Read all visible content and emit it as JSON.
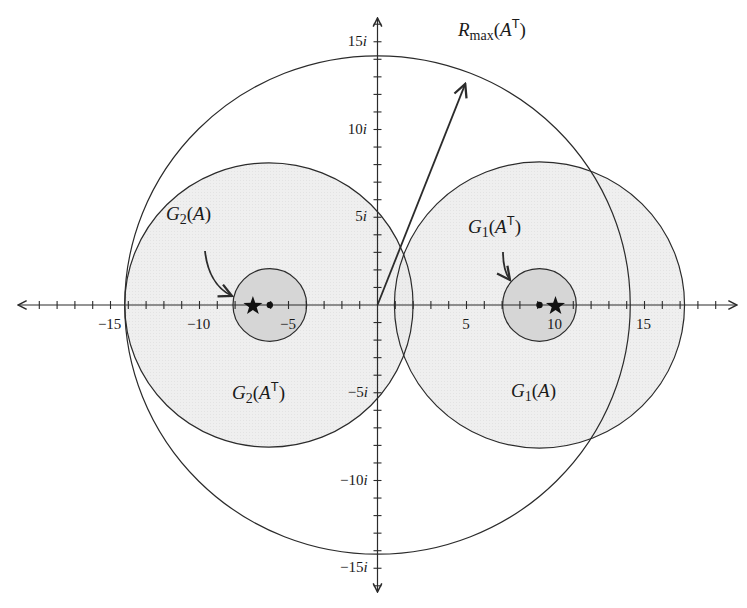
{
  "figure": {
    "colors": {
      "background": "#ffffff",
      "stroke": "#2b2b2b",
      "fill_large": "#ececec",
      "fill_small": "#d6d6d6",
      "text": "#1a1a1a"
    },
    "axes": {
      "origin_px": [
        377.5,
        305
      ],
      "scale_x_px_per_unit": 17.8,
      "scale_y_px_per_unit": 17.55,
      "x_range": [
        -20,
        20
      ],
      "y_range": [
        -16.5,
        16.5
      ],
      "x_tick_min": -20,
      "x_tick_max": 19,
      "y_tick_min": -16,
      "y_tick_max": 16,
      "x_arrow_px": [
        18,
        737
      ],
      "y_arrow_px": [
        18,
        592
      ]
    },
    "x_tick_labels": [
      {
        "value": -15,
        "text": "−15"
      },
      {
        "value": -10,
        "text": "−10"
      },
      {
        "value": -5,
        "text": "−5"
      },
      {
        "value": 5,
        "text": "5"
      },
      {
        "value": 10,
        "text": "10"
      },
      {
        "value": 15,
        "text": "15"
      }
    ],
    "y_tick_labels": [
      {
        "value": 15,
        "num": "15",
        "unit": "i"
      },
      {
        "value": 10,
        "num": "10",
        "unit": "i"
      },
      {
        "value": 5,
        "num": "5",
        "unit": "i"
      },
      {
        "value": -5,
        "num": "−5",
        "unit": "i"
      },
      {
        "value": -10,
        "num": "−10",
        "unit": "i"
      },
      {
        "value": -15,
        "num": "−15",
        "unit": "i"
      }
    ],
    "discs": [
      {
        "name": "G2(A^T)",
        "center": [
          -6.1,
          0
        ],
        "radius": 8.1,
        "fill": "large"
      },
      {
        "name": "G1(A)",
        "center": [
          9.1,
          0
        ],
        "radius": 8.15,
        "fill": "large"
      },
      {
        "name": "G2(A)",
        "center": [
          -6.05,
          0
        ],
        "radius": 2.07,
        "fill": "small"
      },
      {
        "name": "G1(A^T)",
        "center": [
          9.1,
          0
        ],
        "radius": 2.07,
        "fill": "small"
      }
    ],
    "bound_circle": {
      "name": "R_max(A^T)",
      "center": [
        0,
        0
      ],
      "radius": 14.2
    },
    "bound_arrow": {
      "from": [
        0,
        0
      ],
      "to": [
        4.93,
        12.6
      ]
    },
    "eigenvalues_stars": [
      [
        -7,
        0
      ],
      [
        10,
        0
      ]
    ],
    "diagonal_dots": [
      [
        -6.05,
        0
      ],
      [
        9.1,
        0
      ]
    ],
    "labels": {
      "rmax": {
        "main": "R",
        "sub": "max",
        "arg": "A",
        "sup": "T",
        "pos_px": [
          458,
          20
        ]
      },
      "g2a": {
        "main": "G",
        "sub": "2",
        "arg": "A",
        "sup": "",
        "pos_px": [
          166,
          204
        ]
      },
      "g1at": {
        "main": "G",
        "sub": "1",
        "arg": "A",
        "sup": "T",
        "pos_px": [
          468,
          217
        ]
      },
      "g2at": {
        "main": "G",
        "sub": "2",
        "arg": "A",
        "sup": "T",
        "pos_px": [
          232,
          383
        ]
      },
      "g1a": {
        "main": "G",
        "sub": "1",
        "arg": "A",
        "sup": "",
        "pos_px": [
          511,
          381
        ]
      }
    },
    "pointer_arrows": [
      {
        "name": "g2a-pointer",
        "path": "M 205 251 C 207 270, 215 288, 232 296"
      },
      {
        "name": "g1at-pointer",
        "path": "M 503 252 C 503 262, 504 272, 510 280"
      }
    ]
  }
}
